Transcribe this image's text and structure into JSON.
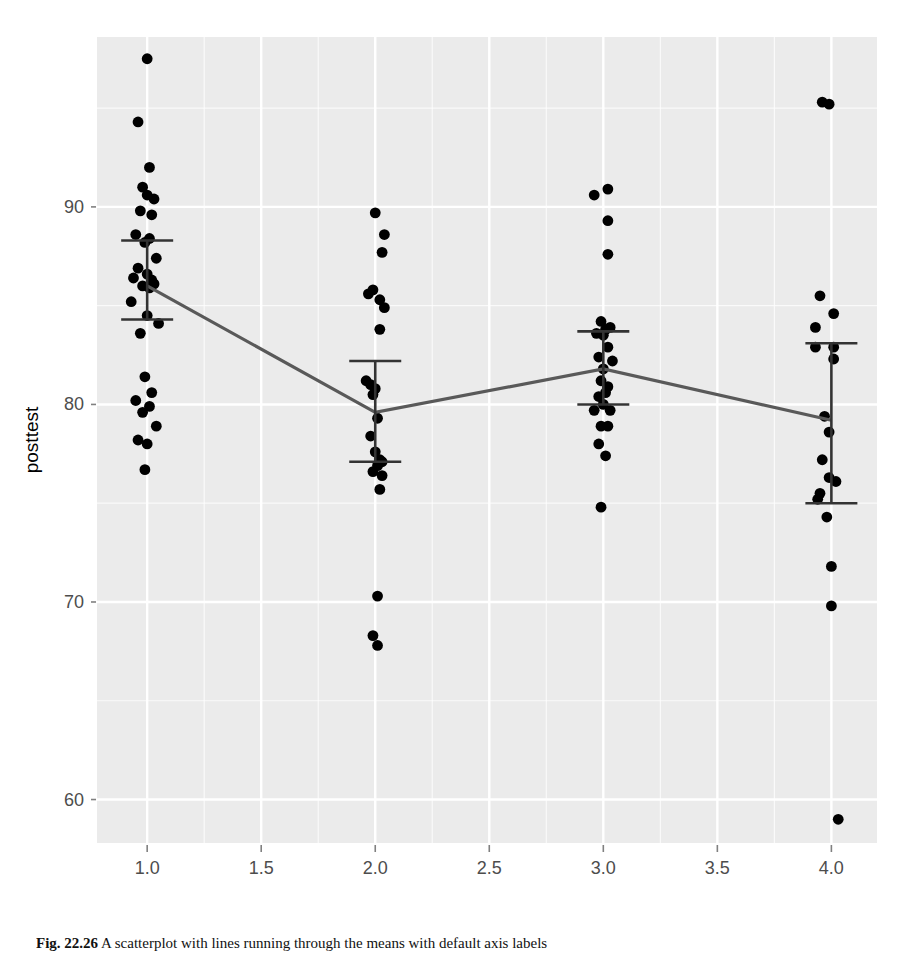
{
  "figure": {
    "caption_label": "Fig. 22.26",
    "caption_text": "A scatterplot with lines running through the means with default axis labels"
  },
  "chart_data": {
    "type": "scatter",
    "title": "",
    "xlabel": "as.numeric(workshop)",
    "ylabel": "posttest",
    "xlim": [
      0.78,
      4.2
    ],
    "ylim": [
      57.8,
      98.6
    ],
    "xticks": [
      "1.0",
      "1.5",
      "2.0",
      "2.5",
      "3.0",
      "3.5",
      "4.0"
    ],
    "xtick_values": [
      1.0,
      1.5,
      2.0,
      2.5,
      3.0,
      3.5,
      4.0
    ],
    "yticks": [
      "60",
      "70",
      "80",
      "90"
    ],
    "ytick_values": [
      60,
      70,
      80,
      90
    ],
    "grid": true,
    "grid_color": "#ffffff",
    "panel_color": "#ebebeb",
    "point_color": "#000000",
    "line_color": "#595959",
    "errorbar_color": "#333333",
    "legend": "none",
    "categories": [
      1,
      2,
      3,
      4
    ],
    "means": [
      86.0,
      79.6,
      81.8,
      79.2
    ],
    "errorbar_upper": [
      88.3,
      82.2,
      83.7,
      83.1
    ],
    "errorbar_lower": [
      84.3,
      77.1,
      80.0,
      75.0
    ],
    "series": [
      {
        "name": "workshop 1",
        "x": [
          1.0,
          0.96,
          1.01,
          0.98,
          1.0,
          1.03,
          0.97,
          1.02,
          0.95,
          1.01,
          0.99,
          1.04,
          0.96,
          1.0,
          0.94,
          1.02,
          1.03,
          0.98,
          1.01,
          0.93,
          1.0,
          1.05,
          0.97,
          0.99,
          1.02,
          0.95,
          1.01,
          0.98,
          1.04,
          0.96,
          1.0,
          0.99
        ],
        "y": [
          97.5,
          94.3,
          92.0,
          91.0,
          90.6,
          90.4,
          89.8,
          89.6,
          88.6,
          88.4,
          88.2,
          87.4,
          86.9,
          86.6,
          86.4,
          86.3,
          86.1,
          86.0,
          85.9,
          85.2,
          84.5,
          84.1,
          83.6,
          81.4,
          80.6,
          80.2,
          79.9,
          79.6,
          78.9,
          78.2,
          78.0,
          76.7
        ]
      },
      {
        "name": "workshop 2",
        "x": [
          2.0,
          2.04,
          2.03,
          1.97,
          1.99,
          2.02,
          2.04,
          2.02,
          1.96,
          1.98,
          2.0,
          1.99,
          2.01,
          1.98,
          2.0,
          2.02,
          2.03,
          2.01,
          1.99,
          2.03,
          2.02,
          2.01
        ],
        "y": [
          89.7,
          88.6,
          87.7,
          85.6,
          85.8,
          85.3,
          84.9,
          83.8,
          81.2,
          81.0,
          80.8,
          80.5,
          79.3,
          78.4,
          77.6,
          77.2,
          77.1,
          76.9,
          76.6,
          76.4,
          75.7,
          70.3
        ]
      },
      {
        "name": "workshop 2 low",
        "x": [
          1.99,
          2.01
        ],
        "y": [
          68.3,
          67.8
        ]
      },
      {
        "name": "workshop 3",
        "x": [
          2.96,
          3.02,
          3.02,
          3.02,
          2.99,
          3.03,
          3.01,
          2.97,
          3.0,
          3.02,
          2.98,
          3.04,
          3.0,
          2.99,
          3.02,
          3.01,
          2.98,
          3.0,
          2.96,
          3.03,
          2.99,
          3.02,
          2.98,
          3.01,
          2.99
        ],
        "y": [
          90.6,
          90.9,
          89.3,
          87.6,
          84.2,
          83.9,
          83.8,
          83.6,
          83.5,
          82.9,
          82.4,
          82.2,
          81.8,
          81.2,
          80.9,
          80.6,
          80.4,
          80.0,
          79.7,
          79.7,
          78.9,
          78.9,
          78.0,
          77.4,
          74.8
        ]
      },
      {
        "name": "workshop 4",
        "x": [
          3.96,
          3.99,
          3.95,
          4.01,
          3.93,
          4.01,
          3.93,
          4.01,
          3.97,
          3.99,
          3.96,
          3.99,
          4.02,
          3.95,
          3.94,
          3.98,
          4.0,
          4.0,
          4.03
        ],
        "y": [
          95.3,
          95.2,
          85.5,
          84.6,
          83.9,
          82.9,
          82.9,
          82.3,
          79.4,
          78.6,
          77.2,
          76.3,
          76.1,
          75.5,
          75.2,
          74.3,
          71.8,
          69.8,
          59.0
        ]
      }
    ]
  }
}
